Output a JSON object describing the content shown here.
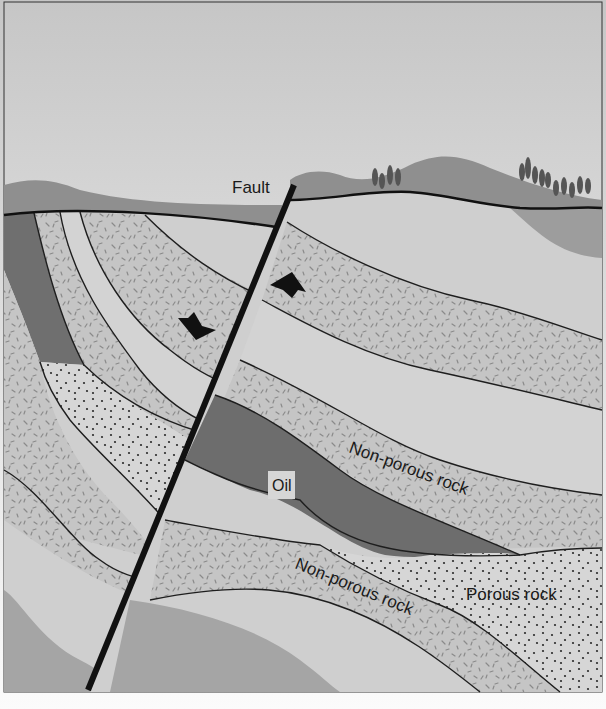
{
  "diagram": {
    "type": "geologic cross-section",
    "labels": {
      "fault": "Fault",
      "oil": "Oil",
      "non_porous_upper": "Non-porous rock",
      "non_porous_lower": "Non-porous rock",
      "porous": "Porous rock"
    },
    "arrows": [
      {
        "name": "upthrown-block-arrow",
        "direction": "up",
        "side": "right of fault"
      },
      {
        "name": "downthrown-block-arrow",
        "direction": "down",
        "side": "left of fault"
      }
    ],
    "layers": [
      {
        "name": "surface-hills",
        "fill": "dark gray"
      },
      {
        "name": "plain-light-layer",
        "fill": "light gray"
      },
      {
        "name": "non-porous-rock-layer",
        "pattern": "dashes"
      },
      {
        "name": "oil-reservoir",
        "fill": "dark gray"
      },
      {
        "name": "porous-rock-layer",
        "pattern": "dots"
      },
      {
        "name": "deep-medium-layer",
        "fill": "medium gray"
      }
    ],
    "colors": {
      "sky_top": "#c9c9c9",
      "sky_bottom": "#fafafa",
      "hills": "#8e8e8e",
      "light_rock": "#cfcfcf",
      "patterned_rock": "#c4c4c4",
      "oil": "#6d6d6d",
      "medium_rock": "#a6a6a6",
      "fault_line": "#111111",
      "boundary": "#1e1e1e"
    }
  }
}
